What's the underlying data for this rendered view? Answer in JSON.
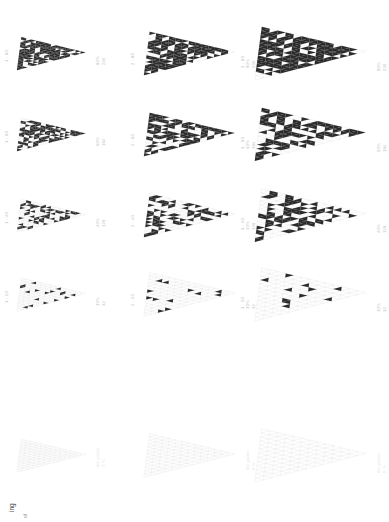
{
  "figure": {
    "axis_title": "ing",
    "axis_sub": "ol",
    "background": "#ffffff",
    "fill_color": "#2b2b2b",
    "mesh_color": "#e8e8e8",
    "label_color": "#bdbdbd"
  },
  "chart_data": {
    "type": "heatmap",
    "title": "",
    "xlabel": "",
    "ylabel": "ing",
    "grid": false,
    "legend_position": "none",
    "columns": [
      "1",
      "2",
      "3"
    ],
    "rows": [
      "80",
      "60",
      "40",
      "10",
      "tile points"
    ],
    "cells": [
      {
        "row": 0,
        "col": 0,
        "left_label": "1 - 80",
        "right_label": "80%",
        "right_value": "239",
        "density": 80,
        "count": 239,
        "scale": 0.62
      },
      {
        "row": 0,
        "col": 1,
        "left_label": "2 - 80",
        "right_label": "80%",
        "right_value": "239",
        "density": 80,
        "count": 239,
        "scale": 0.82
      },
      {
        "row": 0,
        "col": 2,
        "left_label": "3 - 80",
        "right_label": "80%",
        "right_value": "239",
        "density": 80,
        "count": 239,
        "scale": 1.0
      },
      {
        "row": 1,
        "col": 0,
        "left_label": "1 - 60",
        "right_label": "60%",
        "right_value": "184",
        "density": 60,
        "count": 184,
        "scale": 0.62
      },
      {
        "row": 1,
        "col": 1,
        "left_label": "2 - 60",
        "right_label": "60%",
        "right_value": "184",
        "density": 60,
        "count": 184,
        "scale": 0.82
      },
      {
        "row": 1,
        "col": 2,
        "left_label": "3 - 60",
        "right_label": "60%",
        "right_value": "184",
        "density": 60,
        "count": 184,
        "scale": 1.0
      },
      {
        "row": 2,
        "col": 0,
        "left_label": "1 - 40",
        "right_label": "40%",
        "right_value": "128",
        "density": 40,
        "count": 128,
        "scale": 0.62
      },
      {
        "row": 2,
        "col": 1,
        "left_label": "2 - 40",
        "right_label": "40%",
        "right_value": "128",
        "density": 40,
        "count": 128,
        "scale": 0.82
      },
      {
        "row": 2,
        "col": 2,
        "left_label": "3 - 40",
        "right_label": "40%",
        "right_value": "128",
        "density": 40,
        "count": 128,
        "scale": 1.0
      },
      {
        "row": 3,
        "col": 0,
        "left_label": "1 - 10",
        "right_label": "10%",
        "right_value": "32",
        "density": 10,
        "count": 32,
        "scale": 0.62
      },
      {
        "row": 3,
        "col": 1,
        "left_label": "2 - 10",
        "right_label": "10%",
        "right_value": "32",
        "density": 10,
        "count": 32,
        "scale": 0.82
      },
      {
        "row": 3,
        "col": 2,
        "left_label": "3 - 10",
        "right_label": "10%",
        "right_value": "32",
        "density": 10,
        "count": 32,
        "scale": 1.0
      },
      {
        "row": 4,
        "col": 0,
        "left_label": "",
        "right_label": "tile points",
        "right_value": "0 %",
        "density": 0,
        "count": 0,
        "scale": 0.62
      },
      {
        "row": 4,
        "col": 1,
        "left_label": "",
        "right_label": "tile points",
        "right_value": "0 %",
        "density": 0,
        "count": 0,
        "scale": 0.82
      },
      {
        "row": 4,
        "col": 2,
        "left_label": "",
        "right_label": "tile points",
        "right_value": "0 %",
        "density": 0,
        "count": 0,
        "scale": 1.0
      }
    ]
  }
}
